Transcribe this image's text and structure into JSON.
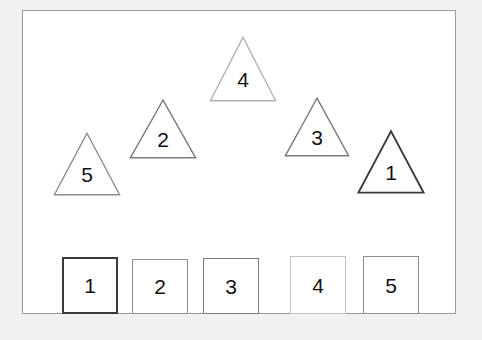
{
  "canvas": {
    "width": 482,
    "height": 340,
    "page_background": "#f1f1f1"
  },
  "frame": {
    "border_color": "#9a9a9a",
    "background": "#ffffff",
    "x": 22,
    "y": 10,
    "width": 434,
    "height": 304
  },
  "triangles": [
    {
      "id": "triangle-5",
      "label": "5",
      "x": 53,
      "y": 132,
      "width": 68,
      "height": 64,
      "stroke": "#8d8d8d",
      "stroke_width": 1.4,
      "fill": "#ffffff"
    },
    {
      "id": "triangle-2",
      "label": "2",
      "x": 129,
      "y": 99,
      "width": 68,
      "height": 60,
      "stroke": "#7c7c7c",
      "stroke_width": 1.4,
      "fill": "#ffffff"
    },
    {
      "id": "triangle-4",
      "label": "4",
      "x": 209,
      "y": 36,
      "width": 68,
      "height": 66,
      "stroke": "#b4b4b4",
      "stroke_width": 1.4,
      "fill": "#ffffff"
    },
    {
      "id": "triangle-3",
      "label": "3",
      "x": 284,
      "y": 97,
      "width": 66,
      "height": 60,
      "stroke": "#7c7c7c",
      "stroke_width": 1.4,
      "fill": "#ffffff"
    },
    {
      "id": "triangle-1",
      "label": "1",
      "x": 357,
      "y": 130,
      "width": 68,
      "height": 64,
      "stroke": "#3a3a3a",
      "stroke_width": 1.8,
      "fill": "#ffffff"
    }
  ],
  "squares": [
    {
      "id": "square-1",
      "label": "1",
      "x": 62,
      "y": 257,
      "width": 56,
      "height": 57,
      "stroke": "#3a3a3a",
      "stroke_width": 2,
      "fill": "#ffffff"
    },
    {
      "id": "square-2",
      "label": "2",
      "x": 132,
      "y": 259,
      "width": 56,
      "height": 55,
      "stroke": "#8d8d8d",
      "stroke_width": 1.4,
      "fill": "#ffffff"
    },
    {
      "id": "square-3",
      "label": "3",
      "x": 203,
      "y": 258,
      "width": 56,
      "height": 56,
      "stroke": "#7c7c7c",
      "stroke_width": 1.4,
      "fill": "#ffffff"
    },
    {
      "id": "square-4",
      "label": "4",
      "x": 290,
      "y": 256,
      "width": 56,
      "height": 58,
      "stroke": "#c3c3c3",
      "stroke_width": 1.4,
      "fill": "#ffffff"
    },
    {
      "id": "square-5",
      "label": "5",
      "x": 363,
      "y": 256,
      "width": 56,
      "height": 58,
      "stroke": "#8d8d8d",
      "stroke_width": 1.4,
      "fill": "#ffffff"
    }
  ]
}
